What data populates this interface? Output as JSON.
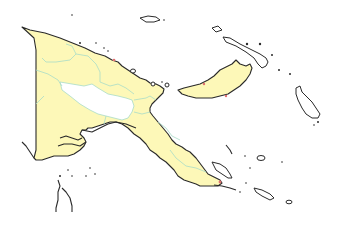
{
  "map": {
    "subject": "Papua New Guinea provinces",
    "colors": {
      "province_fill": "#fdf8b8",
      "highlight_fill": "#ffffff",
      "coastline": "#2a2a2a",
      "province_border": "#a8dcc8",
      "marker": "#e07070",
      "background": "#ffffff"
    },
    "regions": [
      {
        "name": "mainland-western",
        "fill": "province_fill"
      },
      {
        "name": "mainland-highlands",
        "fill": "highlight_fill"
      },
      {
        "name": "mainland-northern",
        "fill": "province_fill"
      },
      {
        "name": "mainland-southeast",
        "fill": "province_fill"
      },
      {
        "name": "new-britain",
        "fill": "province_fill"
      },
      {
        "name": "new-ireland",
        "fill": "highlight_fill"
      },
      {
        "name": "bougainville",
        "fill": "highlight_fill"
      },
      {
        "name": "manus",
        "fill": "highlight_fill"
      },
      {
        "name": "milne-bay-islands",
        "fill": "highlight_fill"
      }
    ]
  }
}
